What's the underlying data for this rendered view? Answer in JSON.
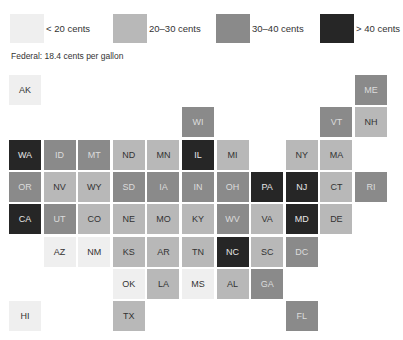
{
  "chart_data": {
    "type": "heatmap",
    "subtitle": "Federal: 18.4 cents per gallon",
    "legend": [
      {
        "label": "< 20 cents",
        "color": "#efefef",
        "class": 0
      },
      {
        "label": "20–30 cents",
        "color": "#b8b8b8",
        "class": 1
      },
      {
        "label": "30–40 cents",
        "color": "#8a8a8a",
        "class": 2
      },
      {
        "label": "> 40 cents",
        "color": "#262626",
        "class": 3
      }
    ],
    "states": [
      {
        "abbr": "AK",
        "row": 0,
        "col": 0,
        "class": 0
      },
      {
        "abbr": "ME",
        "row": 0,
        "col": 10,
        "class": 2
      },
      {
        "abbr": "WI",
        "row": 1,
        "col": 5,
        "class": 2
      },
      {
        "abbr": "VT",
        "row": 1,
        "col": 9,
        "class": 2
      },
      {
        "abbr": "NH",
        "row": 1,
        "col": 10,
        "class": 1
      },
      {
        "abbr": "WA",
        "row": 2,
        "col": 0,
        "class": 3
      },
      {
        "abbr": "ID",
        "row": 2,
        "col": 1,
        "class": 2
      },
      {
        "abbr": "MT",
        "row": 2,
        "col": 2,
        "class": 2
      },
      {
        "abbr": "ND",
        "row": 2,
        "col": 3,
        "class": 1
      },
      {
        "abbr": "MN",
        "row": 2,
        "col": 4,
        "class": 1
      },
      {
        "abbr": "IL",
        "row": 2,
        "col": 5,
        "class": 3
      },
      {
        "abbr": "MI",
        "row": 2,
        "col": 6,
        "class": 1
      },
      {
        "abbr": "NY",
        "row": 2,
        "col": 8,
        "class": 1
      },
      {
        "abbr": "MA",
        "row": 2,
        "col": 9,
        "class": 1
      },
      {
        "abbr": "OR",
        "row": 3,
        "col": 0,
        "class": 2
      },
      {
        "abbr": "NV",
        "row": 3,
        "col": 1,
        "class": 1
      },
      {
        "abbr": "WY",
        "row": 3,
        "col": 2,
        "class": 1
      },
      {
        "abbr": "SD",
        "row": 3,
        "col": 3,
        "class": 2
      },
      {
        "abbr": "IA",
        "row": 3,
        "col": 4,
        "class": 2
      },
      {
        "abbr": "IN",
        "row": 3,
        "col": 5,
        "class": 2
      },
      {
        "abbr": "OH",
        "row": 3,
        "col": 6,
        "class": 2
      },
      {
        "abbr": "PA",
        "row": 3,
        "col": 7,
        "class": 3
      },
      {
        "abbr": "NJ",
        "row": 3,
        "col": 8,
        "class": 3
      },
      {
        "abbr": "CT",
        "row": 3,
        "col": 9,
        "class": 1
      },
      {
        "abbr": "RI",
        "row": 3,
        "col": 10,
        "class": 2
      },
      {
        "abbr": "CA",
        "row": 4,
        "col": 0,
        "class": 3
      },
      {
        "abbr": "UT",
        "row": 4,
        "col": 1,
        "class": 2
      },
      {
        "abbr": "CO",
        "row": 4,
        "col": 2,
        "class": 1
      },
      {
        "abbr": "NE",
        "row": 4,
        "col": 3,
        "class": 1
      },
      {
        "abbr": "MO",
        "row": 4,
        "col": 4,
        "class": 1
      },
      {
        "abbr": "KY",
        "row": 4,
        "col": 5,
        "class": 1
      },
      {
        "abbr": "WV",
        "row": 4,
        "col": 6,
        "class": 2
      },
      {
        "abbr": "VA",
        "row": 4,
        "col": 7,
        "class": 1
      },
      {
        "abbr": "MD",
        "row": 4,
        "col": 8,
        "class": 3
      },
      {
        "abbr": "DE",
        "row": 4,
        "col": 9,
        "class": 1
      },
      {
        "abbr": "AZ",
        "row": 5,
        "col": 1,
        "class": 0
      },
      {
        "abbr": "NM",
        "row": 5,
        "col": 2,
        "class": 0
      },
      {
        "abbr": "KS",
        "row": 5,
        "col": 3,
        "class": 1
      },
      {
        "abbr": "AR",
        "row": 5,
        "col": 4,
        "class": 1
      },
      {
        "abbr": "TN",
        "row": 5,
        "col": 5,
        "class": 1
      },
      {
        "abbr": "NC",
        "row": 5,
        "col": 6,
        "class": 3
      },
      {
        "abbr": "SC",
        "row": 5,
        "col": 7,
        "class": 1
      },
      {
        "abbr": "DC",
        "row": 5,
        "col": 8,
        "class": 2
      },
      {
        "abbr": "OK",
        "row": 6,
        "col": 3,
        "class": 0
      },
      {
        "abbr": "LA",
        "row": 6,
        "col": 4,
        "class": 1
      },
      {
        "abbr": "MS",
        "row": 6,
        "col": 5,
        "class": 0
      },
      {
        "abbr": "AL",
        "row": 6,
        "col": 6,
        "class": 1
      },
      {
        "abbr": "GA",
        "row": 6,
        "col": 7,
        "class": 2
      },
      {
        "abbr": "HI",
        "row": 7,
        "col": 0,
        "class": 0
      },
      {
        "abbr": "TX",
        "row": 7,
        "col": 3,
        "class": 1
      },
      {
        "abbr": "FL",
        "row": 7,
        "col": 8,
        "class": 2
      }
    ]
  },
  "legend": {
    "items": [
      {
        "label": "< 20 cents"
      },
      {
        "label": "20–30 cents"
      },
      {
        "label": "30–40 cents"
      },
      {
        "label": "> 40 cents"
      }
    ]
  },
  "federal_note": "Federal: 18.4 cents per gallon"
}
